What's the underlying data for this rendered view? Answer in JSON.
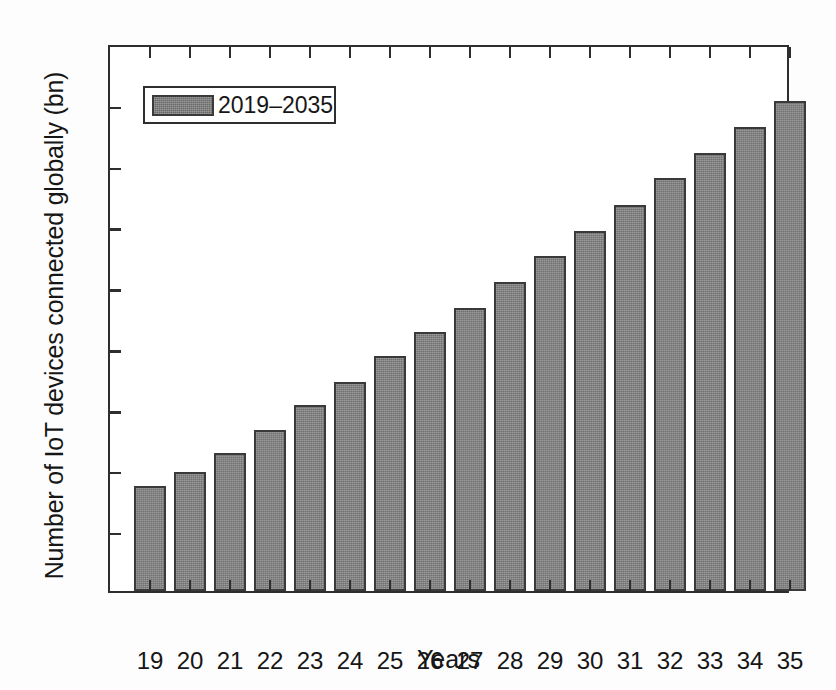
{
  "chart_data": {
    "type": "bar",
    "title": "",
    "xlabel": "Years",
    "ylabel": "Number of IoT devices connected globally (bn)",
    "categories": [
      "19",
      "20",
      "21",
      "22",
      "23",
      "24",
      "25",
      "26",
      "27",
      "28",
      "29",
      "30",
      "31",
      "32",
      "33",
      "34",
      "35"
    ],
    "values": [
      8.6,
      9.8,
      11.3,
      13.2,
      15.3,
      17.2,
      19.3,
      21.3,
      23.2,
      25.4,
      27.5,
      29.6,
      31.7,
      33.9,
      36.0,
      38.1,
      40.2
    ],
    "series": [
      {
        "name": "2019–2035",
        "values": [
          8.6,
          9.8,
          11.3,
          13.2,
          15.3,
          17.2,
          19.3,
          21.3,
          23.2,
          25.4,
          27.5,
          29.6,
          31.7,
          33.9,
          36.0,
          38.1,
          40.2
        ]
      }
    ],
    "ylim": [
      0,
      45
    ],
    "yticks": [
      0,
      5,
      10,
      15,
      20,
      25,
      30,
      35,
      40,
      45
    ],
    "ytick_labels": [
      "0",
      "5",
      "10",
      "15",
      "20",
      "25",
      "30",
      "35",
      "40",
      "45"
    ],
    "grid": false,
    "legend_position": "top-left",
    "bar_color": "#828282",
    "bar_edge_color": "#3a3a3a",
    "axis_color": "#2e2e2e"
  },
  "legend": {
    "entries": [
      {
        "label": "2019–2035",
        "color": "#7c7c7c"
      }
    ]
  },
  "axes": {
    "x_title": "Years",
    "y_title": "Number of IoT devices connected globally (bn)"
  }
}
